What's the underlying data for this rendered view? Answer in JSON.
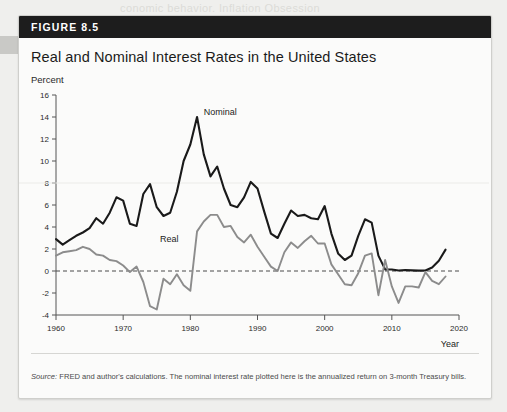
{
  "figure": {
    "badge": "FIGURE 8.5",
    "title": "Real and Nominal Interest Rates in the United States",
    "source_label": "Source:",
    "source_text": " FRED and author's calculations. The nominal interest rate plotted here is the annualized return on 3-month Treasury bills."
  },
  "bleed_text": {
    "top": "conomic behavior. Inflation Obsession",
    "bottom": "explain the extraordinary behavior of interest rates in the"
  },
  "colors": {
    "nominal": "#1a1a1a",
    "real": "#8c8c8c",
    "zero_line": "#4a4a4a",
    "axis": "#555555",
    "header_bg": "#1d1d1d",
    "panel_bg": "#fbfbfa"
  },
  "chart_data": {
    "type": "line",
    "title": "Real and Nominal Interest Rates in the United States",
    "xlabel": "Year",
    "ylabel": "Percent",
    "xlim": [
      1960,
      2020
    ],
    "ylim": [
      -4,
      16
    ],
    "xticks": [
      1960,
      1970,
      1980,
      1990,
      2000,
      2010,
      2020
    ],
    "yticks": [
      -4,
      -2,
      0,
      2,
      4,
      6,
      8,
      10,
      12,
      14,
      16
    ],
    "grid": false,
    "zero_reference_line": 0,
    "legend": "inline-annotations",
    "annotations": [
      {
        "text": "Nominal",
        "x": 1982.0,
        "y": 14.2
      },
      {
        "text": "Real",
        "x": 1975.5,
        "y": 2.6
      }
    ],
    "x": [
      1960,
      1961,
      1962,
      1963,
      1964,
      1965,
      1966,
      1967,
      1968,
      1969,
      1970,
      1971,
      1972,
      1973,
      1974,
      1975,
      1976,
      1977,
      1978,
      1979,
      1980,
      1981,
      1982,
      1983,
      1984,
      1985,
      1986,
      1987,
      1988,
      1989,
      1990,
      1991,
      1992,
      1993,
      1994,
      1995,
      1996,
      1997,
      1998,
      1999,
      2000,
      2001,
      2002,
      2003,
      2004,
      2005,
      2006,
      2007,
      2008,
      2009,
      2010,
      2011,
      2012,
      2013,
      2014,
      2015,
      2016,
      2017,
      2018
    ],
    "series": [
      {
        "name": "Nominal",
        "color": "#1a1a1a",
        "values": [
          2.9,
          2.4,
          2.8,
          3.2,
          3.5,
          3.9,
          4.8,
          4.3,
          5.3,
          6.7,
          6.4,
          4.3,
          4.1,
          7.0,
          7.9,
          5.8,
          5.0,
          5.3,
          7.2,
          10.0,
          11.5,
          14.0,
          10.6,
          8.6,
          9.5,
          7.5,
          6.0,
          5.8,
          6.7,
          8.1,
          7.5,
          5.4,
          3.4,
          3.0,
          4.3,
          5.5,
          5.0,
          5.1,
          4.8,
          4.7,
          5.9,
          3.4,
          1.6,
          1.0,
          1.4,
          3.2,
          4.7,
          4.4,
          1.4,
          0.15,
          0.14,
          0.05,
          0.09,
          0.06,
          0.03,
          0.05,
          0.32,
          0.93,
          1.94
        ]
      },
      {
        "name": "Real",
        "color": "#8c8c8c",
        "values": [
          1.4,
          1.7,
          1.8,
          1.9,
          2.2,
          2.0,
          1.5,
          1.4,
          1.0,
          0.9,
          0.5,
          -0.1,
          0.4,
          -1.0,
          -3.2,
          -3.5,
          -0.7,
          -1.2,
          -0.3,
          -1.3,
          -1.8,
          3.6,
          4.5,
          5.1,
          5.1,
          4.0,
          4.1,
          3.1,
          2.6,
          3.3,
          2.2,
          1.3,
          0.4,
          0.0,
          1.7,
          2.6,
          2.1,
          2.7,
          3.2,
          2.5,
          2.5,
          0.6,
          -0.3,
          -1.2,
          -1.3,
          -0.2,
          1.4,
          1.6,
          -2.2,
          1.0,
          -1.4,
          -2.9,
          -1.4,
          -1.4,
          -1.5,
          -0.1,
          -0.9,
          -1.2,
          -0.5
        ]
      }
    ]
  }
}
